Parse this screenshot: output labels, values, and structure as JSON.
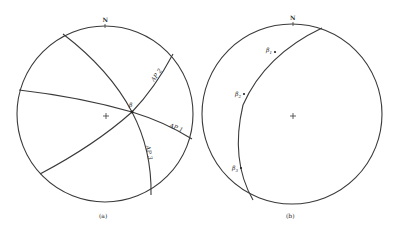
{
  "figure": {
    "panels": [
      {
        "id": "a",
        "caption": "(a)",
        "north_label": "N",
        "intersection_label": "β",
        "planes": [
          {
            "name": "AP 1",
            "prefix": "AP",
            "index": "1"
          },
          {
            "name": "AP 2",
            "prefix": "AP",
            "index": "2"
          },
          {
            "name": "AP 3",
            "prefix": "AP",
            "index": "3"
          }
        ]
      },
      {
        "id": "b",
        "caption": "(b)",
        "north_label": "N",
        "points": [
          {
            "symbol": "β",
            "index": "1"
          },
          {
            "symbol": "β",
            "index": "2"
          },
          {
            "symbol": "β",
            "index": "3"
          }
        ]
      }
    ],
    "line_color": "#3a3a3a",
    "background": "#ffffff"
  }
}
